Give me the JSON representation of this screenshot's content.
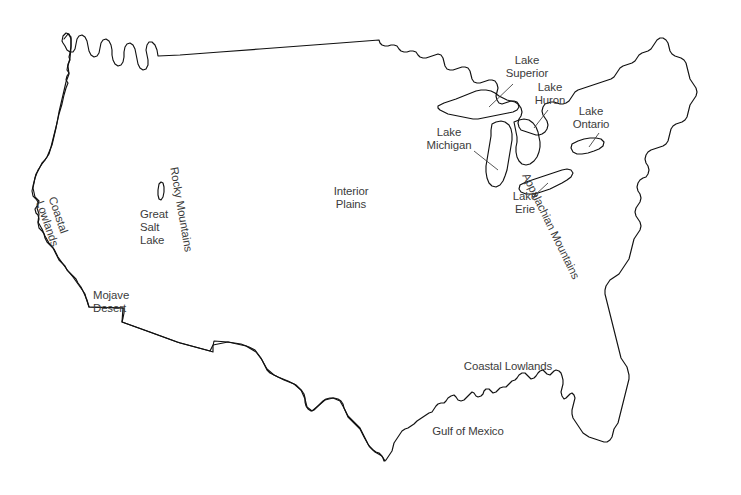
{
  "map": {
    "title": "Physical Features of the United States",
    "outline_color": "#111111",
    "label_color": "#3b3b3b",
    "background_color": "#ffffff",
    "width": 741,
    "height": 495
  },
  "labels": {
    "lake_superior": "Lake\nSuperior",
    "lake_huron": "Lake\nHuron",
    "lake_ontario": "Lake\nOntario",
    "lake_michigan": "Lake\nMichigan",
    "lake_erie": "Lake\nErie",
    "interior_plains": "Interior\nPlains",
    "rocky_mountains": "Rocky Mountains",
    "great_salt_lake": "Great\nSalt\nLake",
    "coastal_lowlands_west": "Coastal\nLowlands",
    "mojave_desert": "Mojave\nDesert",
    "appalachian_mountains": "Appalachian Mountains",
    "coastal_lowlands_south": "Coastal Lowlands",
    "gulf_of_mexico": "Gulf of Mexico"
  },
  "features": {
    "lakes": [
      "Lake Superior",
      "Lake Michigan",
      "Lake Huron",
      "Lake Erie",
      "Lake Ontario",
      "Great Salt Lake"
    ],
    "landforms": [
      "Rocky Mountains",
      "Appalachian Mountains",
      "Interior Plains",
      "Coastal Lowlands",
      "Mojave Desert"
    ],
    "water_bodies": [
      "Gulf of Mexico"
    ]
  }
}
